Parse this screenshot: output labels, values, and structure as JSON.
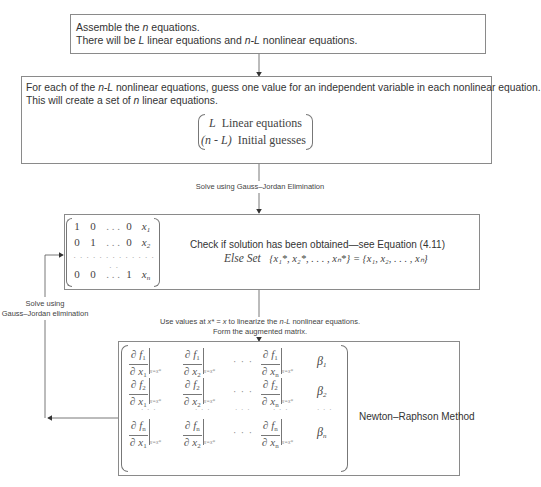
{
  "box1": {
    "line1_pre": "Assemble the ",
    "line1_var": "n",
    "line1_post": " equations.",
    "line2_a": "There will be ",
    "line2_L": "L",
    "line2_b": " linear equations and ",
    "line2_nL": "n-L",
    "line2_c": " nonlinear equations."
  },
  "box2": {
    "line1_a": "For each of the ",
    "line1_nL": "n-L",
    "line1_b": " nonlinear equations, guess one value for an independent variable in each nonlinear equation.",
    "line2_a": "This will create a set of ",
    "line2_n": "n",
    "line2_b": " linear equations.",
    "vector_row1_var": "L",
    "vector_row1_text": "Linear equations",
    "vector_row2_var": "(n - L)",
    "vector_row2_text": "Initial guesses"
  },
  "connector1_label": "Solve using Gauss–Jordan Elimination",
  "box3": {
    "matrix_rows": [
      [
        "1",
        "0",
        "...",
        "0",
        "x1"
      ],
      [
        "0",
        "1",
        "...",
        "0",
        "x2"
      ],
      [
        "...",
        "...",
        "...",
        "...",
        "..."
      ],
      [
        "0",
        "0",
        "...",
        "1",
        "xn"
      ]
    ],
    "check_text": "Check if solution has been obtained—see Equation (4.11)",
    "else_label": "Else Set",
    "else_expr": "{x₁*, x₂*, . . . , xₙ*} = {x₁, x₂, . . . , xₙ}"
  },
  "connector2_label_line1_a": "Use values at ",
  "connector2_label_line1_expr": "x* = x",
  "connector2_label_line1_b": " to linearize the ",
  "connector2_label_line1_nL": "n-L",
  "connector2_label_line1_c": " nonlinear equations.",
  "connector2_label_line2": "Form the augmented matrix.",
  "feedback_label_line1": "Solve using",
  "feedback_label_line2": "Gauss–Jordan elimination",
  "box4": {
    "title": "Newton–Raphson Method",
    "eval_subscript": "x=x*",
    "partial": "∂",
    "rows": [
      {
        "f": "f",
        "fsub": "1",
        "beta": "β",
        "bsub": "1"
      },
      {
        "f": "f",
        "fsub": "2",
        "beta": "β",
        "bsub": "2"
      },
      {
        "f": "f",
        "fsub": "n",
        "beta": "β",
        "bsub": "n"
      }
    ],
    "cols": [
      {
        "x": "x",
        "xsub": "1"
      },
      {
        "x": "x",
        "xsub": "2"
      },
      {
        "x": "x",
        "xsub": "n"
      }
    ],
    "ellipsis": "· · ·",
    "vdots": "· · ·"
  },
  "colors": {
    "line": "#555555",
    "border": "#8a8a8a",
    "text": "#333333"
  }
}
